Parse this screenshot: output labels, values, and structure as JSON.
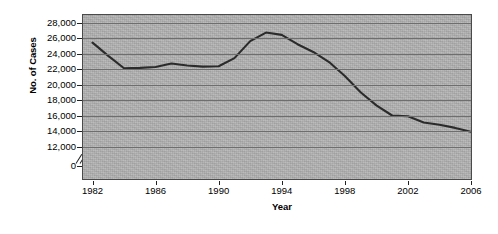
{
  "chart_data": {
    "type": "line",
    "title": "",
    "xlabel": "Year",
    "ylabel": "No. of Cases",
    "xlim": [
      1981,
      2006
    ],
    "ylim": [
      12000,
      28000
    ],
    "y_axis_break": true,
    "y_zero_label": "0",
    "grid": true,
    "legend": "none",
    "line_color": "#2b2b2b",
    "plot_background": "#b3b3b3",
    "y_ticks": [
      {
        "value": 28000,
        "label": "28,000"
      },
      {
        "value": 26000,
        "label": "26,000"
      },
      {
        "value": 24000,
        "label": "24,000"
      },
      {
        "value": 22000,
        "label": "22,000"
      },
      {
        "value": 20000,
        "label": "20,000"
      },
      {
        "value": 18000,
        "label": "18,000"
      },
      {
        "value": 16000,
        "label": "16,000"
      },
      {
        "value": 14000,
        "label": "14,000"
      },
      {
        "value": 12000,
        "label": "12,000"
      },
      {
        "value": 0,
        "label": "0"
      }
    ],
    "x_ticks": [
      {
        "value": 1982,
        "label": "1982"
      },
      {
        "value": 1986,
        "label": "1986"
      },
      {
        "value": 1990,
        "label": "1990"
      },
      {
        "value": 1994,
        "label": "1994"
      },
      {
        "value": 1998,
        "label": "1998"
      },
      {
        "value": 2002,
        "label": "2002"
      },
      {
        "value": 2006,
        "label": "2006"
      }
    ],
    "x": [
      1982,
      1983,
      1984,
      1985,
      1986,
      1987,
      1988,
      1989,
      1990,
      1991,
      1992,
      1993,
      1994,
      1995,
      1996,
      1997,
      1998,
      1999,
      2000,
      2001,
      2002,
      2003,
      2004,
      2005,
      2006
    ],
    "series": [
      {
        "name": "No. of Cases",
        "values": [
          25400,
          23700,
          22100,
          22150,
          22250,
          22700,
          22450,
          22300,
          22350,
          23400,
          25600,
          26700,
          26400,
          25200,
          24200,
          22900,
          21100,
          19000,
          17300,
          16000,
          15900,
          15100,
          14800,
          14400,
          13900
        ]
      }
    ]
  },
  "axes": {
    "y_title": "No. of Cases",
    "x_title": "Year"
  },
  "caption_sliver": ""
}
